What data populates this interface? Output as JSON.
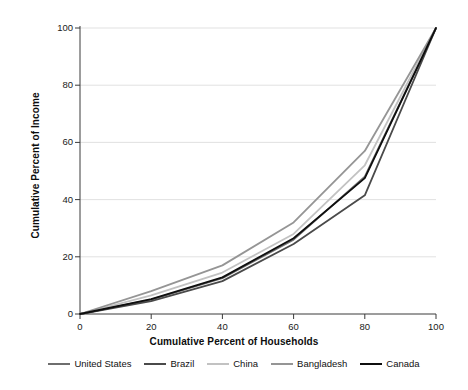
{
  "chart_data": {
    "type": "line",
    "title": "",
    "subtitle": "",
    "xlabel": "Cumulative Percent of Households",
    "ylabel": "Cumulative Percent of Income",
    "xlim": [
      0,
      100
    ],
    "ylim": [
      0,
      100
    ],
    "xticks": [
      0,
      20,
      40,
      60,
      80,
      100
    ],
    "yticks": [
      0,
      20,
      40,
      60,
      80,
      100
    ],
    "xtick_labels": [
      "0",
      "20",
      "40",
      "60",
      "80",
      "100"
    ],
    "ytick_labels": [
      "0",
      "20",
      "40",
      "60",
      "80",
      "100"
    ],
    "grid": "horizontal",
    "grid_color": "#d9d9d9",
    "legend_position": "bottom",
    "x": [
      0,
      20,
      40,
      60,
      80,
      100
    ],
    "series": [
      {
        "name": "United States",
        "color": "#6e6e6e",
        "width": 1.8,
        "values": [
          0,
          5.0,
          12.5,
          26.0,
          48.0,
          100
        ]
      },
      {
        "name": "Brazil",
        "color": "#4a4a4a",
        "width": 1.8,
        "values": [
          0,
          4.5,
          11.5,
          24.5,
          41.5,
          100
        ]
      },
      {
        "name": "China",
        "color": "#c2c2c2",
        "width": 1.8,
        "values": [
          0,
          6.5,
          14.5,
          28.0,
          52.0,
          100
        ]
      },
      {
        "name": "Bangladesh",
        "color": "#959595",
        "width": 1.8,
        "values": [
          0,
          8.0,
          17.0,
          32.0,
          57.0,
          100
        ]
      },
      {
        "name": "Canada",
        "color": "#0f0f0f",
        "width": 1.8,
        "values": [
          0,
          5.2,
          12.8,
          26.5,
          47.5,
          100
        ]
      }
    ]
  },
  "legend": {
    "items": [
      {
        "label": "United States"
      },
      {
        "label": "Brazil"
      },
      {
        "label": "China"
      },
      {
        "label": "Bangladesh"
      },
      {
        "label": "Canada"
      }
    ]
  },
  "axes": {
    "x_title": "Cumulative Percent of Households",
    "y_title": "Cumulative Percent of Income",
    "x_tick_labels": [
      "0",
      "20",
      "40",
      "60",
      "80",
      "100"
    ],
    "y_tick_labels": [
      "0",
      "20",
      "40",
      "60",
      "80",
      "100"
    ]
  }
}
